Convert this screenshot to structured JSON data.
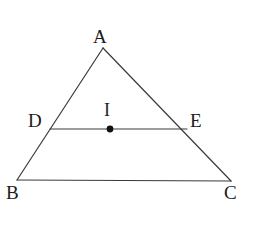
{
  "figure": {
    "kind": "triangle-with-midsegment",
    "background_color": "#ffffff",
    "stroke_color": "#3a3a3a",
    "point_color": "#111111",
    "label_color": "#1c1c1c",
    "stroke_width": 1.2,
    "canvas": {
      "width": 257,
      "height": 228
    },
    "labels": {
      "a": "A",
      "b": "B",
      "c": "C",
      "d": "D",
      "e": "E",
      "i": "I"
    },
    "points": {
      "A": {
        "x": 103,
        "y": 48
      },
      "B": {
        "x": 17,
        "y": 180
      },
      "C": {
        "x": 231,
        "y": 181
      },
      "D": {
        "x": 50,
        "y": 129
      },
      "E": {
        "x": 187,
        "y": 129
      },
      "I": {
        "x": 110,
        "y": 129
      }
    },
    "segments": [
      {
        "name": "side-ab",
        "from": "A",
        "to": "B"
      },
      {
        "name": "side-ac",
        "from": "A",
        "to": "C"
      },
      {
        "name": "side-bc",
        "from": "B",
        "to": "C"
      },
      {
        "name": "segment-de",
        "from": "D",
        "to": "E"
      }
    ],
    "marked_points": [
      {
        "name": "point-i",
        "at": "I",
        "radius": 3.4,
        "filled": true
      }
    ]
  }
}
